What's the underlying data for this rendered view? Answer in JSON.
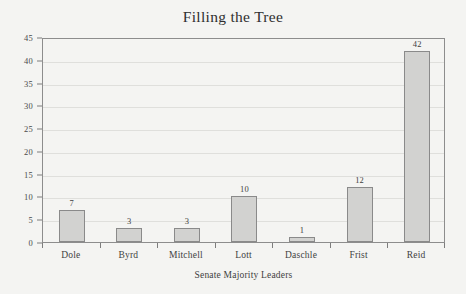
{
  "chart_data": {
    "type": "bar",
    "title": "Filling the Tree",
    "xlabel": "Senate Majority Leaders",
    "ylabel": "",
    "categories": [
      "Dole",
      "Byrd",
      "Mitchell",
      "Lott",
      "Daschle",
      "Frist",
      "Reid"
    ],
    "values": [
      7,
      3,
      3,
      10,
      1,
      12,
      42
    ],
    "value_labels": [
      "7",
      "3",
      "3",
      "10",
      "1",
      "12",
      "42"
    ],
    "ylim": [
      0,
      45
    ],
    "ytick_values": [
      0,
      5,
      10,
      15,
      20,
      25,
      30,
      35,
      40,
      45
    ],
    "ytick_labels": [
      "0",
      "5",
      "10",
      "15",
      "20",
      "25",
      "30",
      "35",
      "40",
      "45"
    ],
    "grid": true,
    "legend": "none",
    "colors": {
      "bar_fill": "#d2d2d0",
      "bar_border": "#8a8a8a",
      "gridline": "#dfdfdc",
      "axis": "#8d8d8d",
      "text": "#3a3a3a",
      "background": "#f4f4f2"
    }
  }
}
